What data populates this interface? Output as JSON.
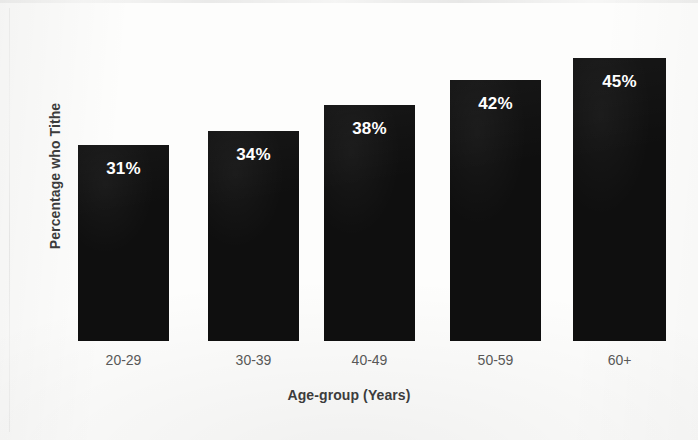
{
  "chart_data": {
    "type": "bar",
    "title": "",
    "subtitle": "",
    "xlabel": "Age-group (Years)",
    "ylabel": "Percentage who Tithe",
    "categories": [
      "20-29",
      "30-39",
      "40-49",
      "50-59",
      "60+"
    ],
    "values": [
      31,
      34,
      38,
      42,
      45
    ],
    "data_labels": [
      "31%",
      "34%",
      "38%",
      "42%",
      "45%"
    ],
    "ylim": [
      0,
      54
    ],
    "grid": false,
    "legend": null,
    "legend_position": "none",
    "series": [
      {
        "name": "Percentage who Tithe",
        "values": [
          31,
          34,
          38,
          42,
          45
        ]
      }
    ],
    "colors": {
      "bar": "#0f0f0f",
      "data_label": "#ffffff",
      "axis_title": "#3c3c3c",
      "tick_label": "#585858",
      "background": "#fdfdfc"
    },
    "bar_geometry": [
      {
        "x": 78,
        "width": 91,
        "height": 196,
        "label_offset": 14
      },
      {
        "x": 208,
        "width": 91,
        "height": 210,
        "label_offset": 14
      },
      {
        "x": 324,
        "width": 91,
        "height": 236,
        "label_offset": 14
      },
      {
        "x": 450,
        "width": 91,
        "height": 261,
        "label_offset": 14
      },
      {
        "x": 573,
        "width": 93,
        "height": 283,
        "label_offset": 14
      }
    ],
    "tick_geometry": [
      {
        "x": 78,
        "width": 91
      },
      {
        "x": 208,
        "width": 91
      },
      {
        "x": 324,
        "width": 91
      },
      {
        "x": 450,
        "width": 91
      },
      {
        "x": 573,
        "width": 93
      }
    ]
  }
}
